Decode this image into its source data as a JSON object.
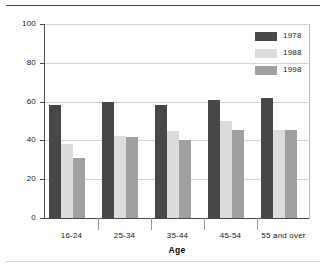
{
  "chart_data": {
    "type": "bar",
    "title": "",
    "xlabel": "Age",
    "ylabel": "Percentage",
    "categories": [
      "16-24",
      "25-34",
      "35-44",
      "45-54",
      "55 and over"
    ],
    "series": [
      {
        "name": "1978",
        "values": [
          58,
          60,
          58,
          61,
          62
        ],
        "color": "#474747"
      },
      {
        "name": "1988",
        "values": [
          38,
          42.5,
          45,
          50,
          45.5
        ],
        "color": "#dcdcdc"
      },
      {
        "name": "1998",
        "values": [
          31,
          42,
          40,
          45.5,
          45.5
        ],
        "color": "#a0a0a0"
      }
    ],
    "ylim": [
      0,
      100
    ],
    "yticks": [
      0,
      20,
      40,
      60,
      80,
      100
    ],
    "ytick_labels": [
      "0",
      "20",
      "40",
      "60",
      "80",
      "100"
    ],
    "grid": true,
    "legend_position": "top-right"
  },
  "legend": {
    "entries": [
      {
        "label": "1978"
      },
      {
        "label": "1988"
      },
      {
        "label": "1998"
      }
    ]
  },
  "colors": {
    "series_1978": "#474747",
    "series_1988": "#dcdcdc",
    "series_1998": "#a0a0a0",
    "axis": "#4a4a4a",
    "gridline": "#d4d4d4",
    "background": "#ffffff"
  }
}
